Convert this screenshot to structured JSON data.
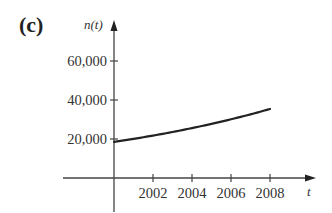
{
  "panel_label": "(c)",
  "chart_data": {
    "type": "line",
    "title": "",
    "xlabel": "t",
    "ylabel": "n(t)",
    "x": [
      2000,
      2001,
      2002,
      2003,
      2004,
      2005,
      2006,
      2007,
      2008
    ],
    "series": [
      {
        "name": "n(t)",
        "values": [
          18500,
          20060,
          21760,
          23600,
          25600,
          27760,
          30100,
          32650,
          35400
        ]
      }
    ],
    "x_ticks": [
      "2002",
      "2004",
      "2006",
      "2008"
    ],
    "y_ticks": [
      "20,000",
      "40,000",
      "60,000"
    ],
    "xlim": [
      2000,
      2011
    ],
    "ylim": [
      0,
      70000
    ],
    "grid": false,
    "legend": null
  },
  "colors": {
    "axis": "#444444",
    "curve": "#222222",
    "text": "#333333"
  }
}
